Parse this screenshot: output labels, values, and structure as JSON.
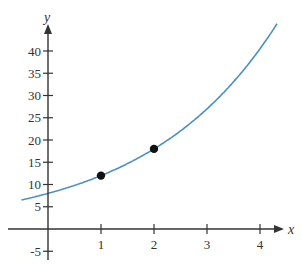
{
  "chart_data": {
    "type": "line",
    "title": "",
    "xlabel": "x",
    "ylabel": "y",
    "xlim": [
      -0.5,
      4.5
    ],
    "ylim": [
      -7,
      45
    ],
    "grid": false,
    "x_ticks": [
      1,
      2,
      3,
      4
    ],
    "y_ticks": [
      -5,
      5,
      10,
      15,
      20,
      25,
      30,
      35,
      40
    ],
    "series": [
      {
        "name": "exponential curve",
        "function": "y = 8 * 1.5^x",
        "color": "#4a8fc7",
        "x": [
          -0.5,
          0,
          0.5,
          1,
          1.5,
          2,
          2.5,
          3,
          3.5,
          4,
          4.3
        ],
        "values": [
          6.5,
          8,
          9.8,
          12,
          14.7,
          18,
          22,
          27,
          33.1,
          40.5,
          45.4
        ]
      }
    ],
    "points": [
      {
        "x": 1,
        "y": 12
      },
      {
        "x": 2,
        "y": 18
      }
    ]
  },
  "labels": {
    "x_axis": "x",
    "y_axis": "y"
  },
  "colors": {
    "axis": "#333333",
    "curve": "#4a8fc7",
    "point": "#111111"
  }
}
